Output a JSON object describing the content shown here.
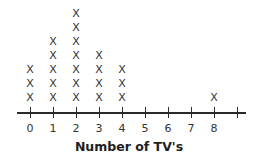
{
  "chart_data": {
    "type": "dot_plot",
    "title": "",
    "xlabel": "Number of TV's",
    "ylabel": "",
    "marker": "X",
    "categories": [
      0,
      1,
      2,
      3,
      4,
      5,
      6,
      7,
      8
    ],
    "tick_positions": [
      0,
      1,
      2,
      3,
      4,
      5,
      6,
      7,
      8,
      9
    ],
    "tick_labels": [
      "0",
      "1",
      "2",
      "3",
      "4",
      "5",
      "6",
      "7",
      "8",
      ""
    ],
    "values": [
      3,
      5,
      7,
      4,
      3,
      0,
      0,
      0,
      1
    ],
    "xlim": [
      0,
      9
    ],
    "grid": false
  }
}
